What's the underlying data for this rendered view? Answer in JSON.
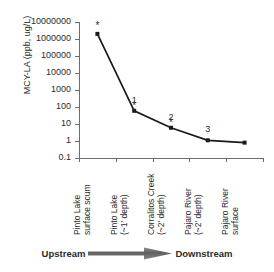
{
  "chart_data": {
    "type": "line",
    "title": "",
    "xlabel": "",
    "ylabel": "MCY-LA (ppb, ug/L)",
    "yscale": "log",
    "ylim": [
      0.1,
      10000000
    ],
    "grid": false,
    "legend": "none",
    "categories": [
      "Pinto Lake surface scum",
      "Pinto Lake (~1' depth)",
      "Corralitos Creek (~2' depth)",
      "Pajaro River (~2' depth)",
      "Pajaro River surface"
    ],
    "category_lines": [
      [
        "Pinto Lake",
        "surface scum"
      ],
      [
        "Pinto Lake",
        "(~1' depth)"
      ],
      [
        "Corralitos Creek",
        "(~2' depth)"
      ],
      [
        "Pajaro River",
        "(~2' depth)"
      ],
      [
        "Pajaro River",
        "surface"
      ]
    ],
    "values": [
      2000000,
      60,
      6,
      1.1,
      0.8
    ],
    "ytick_labels": [
      "10000000",
      "1000000",
      "100000",
      "10000",
      "1000",
      "100",
      "10",
      "1",
      "0.1"
    ],
    "ytick_values": [
      10000000,
      1000000,
      100000,
      10000,
      1000,
      100,
      10,
      1,
      0.1
    ],
    "point_annotations": [
      "",
      "1",
      "2",
      "3",
      ""
    ],
    "point_markers": [
      "*",
      "*",
      "*",
      "",
      ""
    ],
    "series_color": "#1a1a1a",
    "axis_color": "#6d6d6d",
    "annotations": {
      "upstream": "Upstream",
      "downstream": "Downstream",
      "arrow_direction": "left-to-right",
      "arrow_color": "#6f6f6f"
    }
  }
}
